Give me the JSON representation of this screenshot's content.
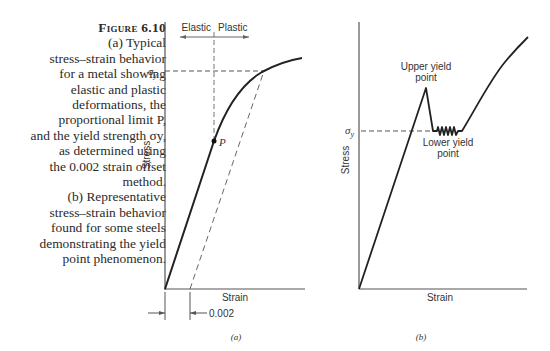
{
  "caption": {
    "figure_label": "Figure 6.10",
    "lines": [
      "(a) Typical",
      "stress–strain behavior",
      "for a metal showing",
      "elastic and plastic",
      "deformations, the",
      "proportional limit P,",
      "and the yield strength σy,",
      "as determined using",
      "the 0.002 strain offset",
      "method.",
      "(b) Representative",
      "stress–strain behavior",
      "found for some steels",
      "demonstrating the yield",
      "point phenomenon."
    ]
  },
  "chart_data": [
    {
      "type": "line",
      "panel_label": "(a)",
      "xlabel": "Strain",
      "ylabel": "Stress",
      "ticks": {
        "y": [
          "σy"
        ],
        "x": []
      },
      "annotations": {
        "region_left": "Elastic",
        "region_right": "Plastic",
        "proportional_limit": "P",
        "offset": "0.002"
      },
      "series": [
        {
          "name": "stress-strain curve",
          "points": [
            [
              0,
              0
            ],
            [
              0.55,
              0.55
            ],
            [
              0.7,
              0.72
            ],
            [
              0.9,
              0.86
            ],
            [
              1.2,
              0.95
            ],
            [
              1.7,
              1.0
            ]
          ]
        },
        {
          "name": "0.002 offset line (dashed)",
          "points": [
            [
              0.15,
              0
            ],
            [
              0.85,
              0.93
            ]
          ]
        }
      ],
      "grid": false
    },
    {
      "type": "line",
      "panel_label": "(b)",
      "xlabel": "Strain",
      "ylabel": "Stress",
      "ticks": {
        "y": [
          "σy"
        ],
        "x": []
      },
      "annotations": {
        "upper_yield": "Upper yield point",
        "lower_yield": "Lower yield point"
      },
      "series": [
        {
          "name": "stress-strain curve",
          "points": [
            [
              0,
              0
            ],
            [
              0.42,
              0.72
            ],
            [
              0.5,
              0.47
            ],
            [
              0.75,
              0.47
            ],
            [
              0.95,
              0.7
            ],
            [
              1.2,
              0.95
            ]
          ]
        }
      ],
      "grid": false
    }
  ]
}
